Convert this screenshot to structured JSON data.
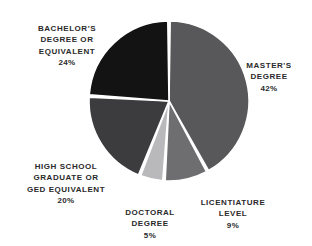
{
  "chart_data": {
    "type": "pie",
    "title": "",
    "subtitle": "",
    "xlabel": "",
    "ylabel": "",
    "legend_position": "none",
    "grid": false,
    "labels_outside": true,
    "start_angle_deg": 0,
    "direction": "clockwise",
    "categories": [
      "Master's Degree",
      "Licentiature Level",
      "Doctoral Degree",
      "High School Graduate or GED Equivalent",
      "Bachelor's Degree or Equivalent"
    ],
    "values": [
      42,
      9,
      5,
      20,
      24
    ],
    "unit": "%",
    "total": 100,
    "slices": [
      {
        "key": "masters",
        "label_lines": "MASTER'S\nDEGREE",
        "value_label": "42%",
        "value": 42,
        "color": "#58585a",
        "start_deg": 0,
        "end_deg": 151.2
      },
      {
        "key": "licentiature",
        "label_lines": "LICENTIATURE\nLEVEL",
        "value_label": "9%",
        "value": 9,
        "color": "#6e6e70",
        "start_deg": 151.2,
        "end_deg": 183.6
      },
      {
        "key": "doctoral",
        "label_lines": "DOCTORAL\nDEGREE",
        "value_label": "5%",
        "value": 5,
        "color": "#b9b9bb",
        "start_deg": 183.6,
        "end_deg": 201.6
      },
      {
        "key": "highschool",
        "label_lines": "HIGH SCHOOL\nGRADUATE OR\nGED EQUIVALENT",
        "value_label": "20%",
        "value": 20,
        "color": "#3c3c3e",
        "start_deg": 201.6,
        "end_deg": 273.6
      },
      {
        "key": "bachelors",
        "label_lines": "BACHELOR'S\nDEGREE OR\nEQUIVALENT",
        "value_label": "24%",
        "value": 24,
        "color": "#131314",
        "start_deg": 273.6,
        "end_deg": 360
      }
    ],
    "geometry": {
      "center_x": 169,
      "center_y": 101,
      "radius": 80,
      "gap_deg": 1.7
    },
    "background_color": "#ffffff",
    "separator_color": "#ffffff",
    "label_text_color": "#2a2a2a"
  }
}
